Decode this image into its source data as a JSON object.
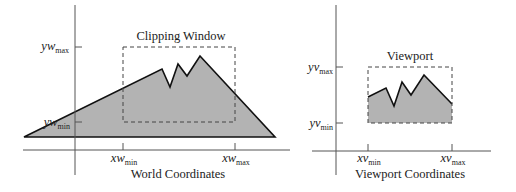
{
  "diagram": {
    "colors": {
      "axis": "#555555",
      "outline": "#111111",
      "fill": "#b3b3b3",
      "dash": "#444444",
      "text": "#222222"
    },
    "world": {
      "caption": "World Coordinates",
      "window_label": "Clipping Window",
      "labels": {
        "yw_max": {
          "base": "yw",
          "sub": "max"
        },
        "yw_min": {
          "base": "yw",
          "sub": "min"
        },
        "xw_min": {
          "base": "xw",
          "sub": "min"
        },
        "xw_max": {
          "base": "xw",
          "sub": "max"
        }
      }
    },
    "viewport": {
      "caption": "Viewport Coordinates",
      "window_label": "Viewport",
      "labels": {
        "yv_max": {
          "base": "yv",
          "sub": "max"
        },
        "yv_min": {
          "base": "yv",
          "sub": "min"
        },
        "xv_min": {
          "base": "xv",
          "sub": "min"
        },
        "xv_max": {
          "base": "xv",
          "sub": "max"
        }
      }
    }
  }
}
